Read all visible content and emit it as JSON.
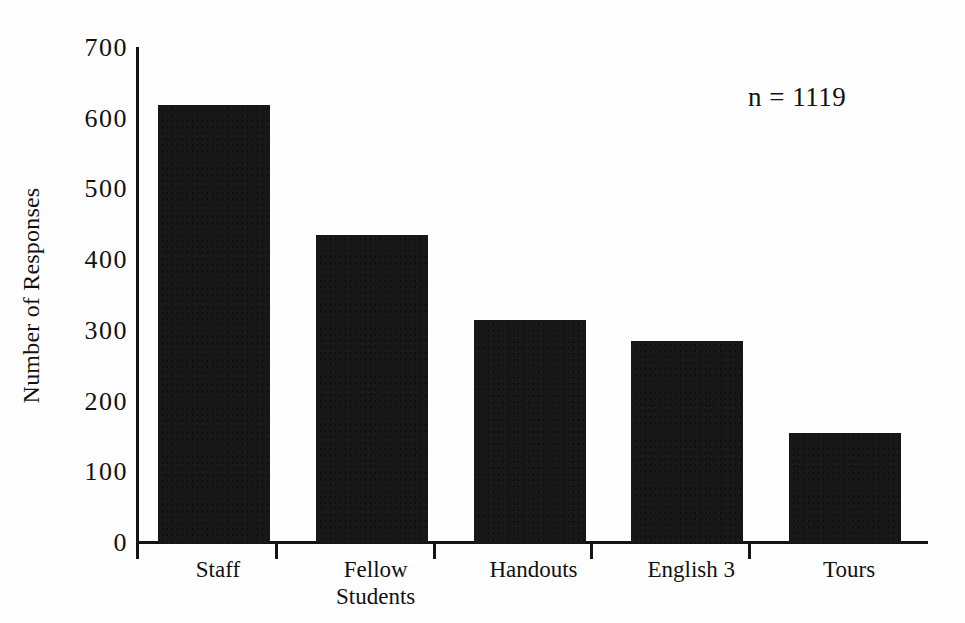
{
  "chart_data": {
    "type": "bar",
    "title": "",
    "subtitle": "",
    "xlabel": "",
    "ylabel": "Number of Responses",
    "categories": [
      "Staff",
      "Fellow\nStudents",
      "Handouts",
      "English 3",
      "Tours"
    ],
    "values": [
      620,
      435,
      315,
      285,
      155
    ],
    "ylim": [
      0,
      700
    ],
    "ytick_labels": [
      "700",
      "600",
      "500",
      "400",
      "300",
      "200",
      "100",
      "0"
    ],
    "ytick_values": [
      700,
      600,
      500,
      400,
      300,
      200,
      100,
      0
    ],
    "ytick_step": 100,
    "grid": false,
    "legend": null,
    "legend_position": "none",
    "annotations": [
      {
        "name": "sample-size",
        "text": "n = 1119"
      }
    ],
    "bar_color": "#171717",
    "axis_color": "#141414",
    "background_color": "#fefefe",
    "x_axis_ticks_between_categories": true,
    "bars": [
      {
        "label": "Staff",
        "value": 620
      },
      {
        "label": "Fellow Students",
        "value": 435
      },
      {
        "label": "Handouts",
        "value": 315
      },
      {
        "label": "English 3",
        "value": 285
      },
      {
        "label": "Tours",
        "value": 155
      }
    ]
  },
  "figure": {
    "annotation_text": "n = 1119",
    "y_axis_title": "Number of Responses"
  }
}
